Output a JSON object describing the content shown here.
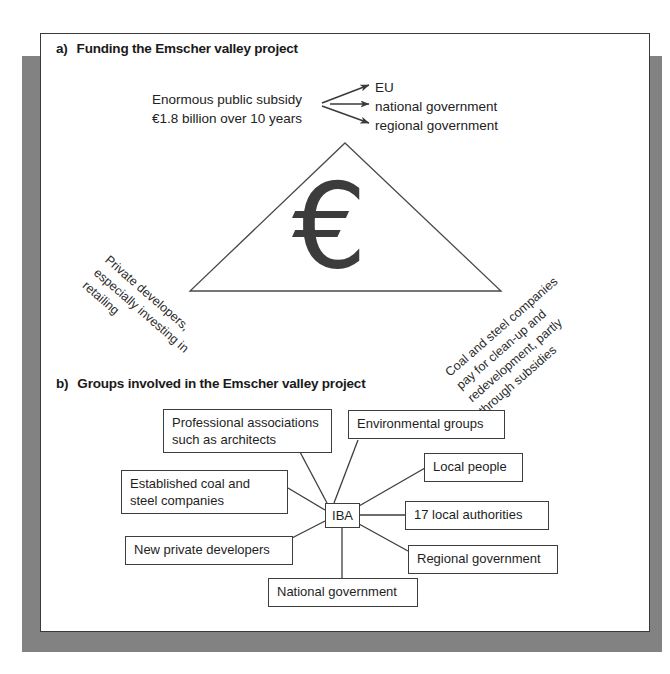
{
  "figure": {
    "sections": [
      {
        "mark": "a)",
        "title": "Funding the Emscher valley project"
      },
      {
        "mark": "b)",
        "title": "Groups involved in the Emscher valley project"
      }
    ]
  },
  "funding": {
    "source_lines": [
      "Enormous public subsidy",
      "€1.8 billion over 10 years"
    ],
    "recipients": [
      "EU",
      "national government",
      "regional government"
    ],
    "currency_symbol": "€",
    "left_caption": [
      "Private developers,",
      "especially investing in",
      "retailing"
    ],
    "right_caption": [
      "Coal and steel companies",
      "pay for clean-up and",
      "redevelopment, partly",
      "through subsidies"
    ]
  },
  "groups": {
    "center": "IBA",
    "nodes": [
      {
        "id": "professional-associations",
        "lines": [
          "Professional associations",
          "such as architects"
        ]
      },
      {
        "id": "environmental-groups",
        "lines": [
          "Environmental groups"
        ]
      },
      {
        "id": "local-people",
        "lines": [
          "Local people"
        ]
      },
      {
        "id": "established-coal-steel",
        "lines": [
          "Established coal and",
          "steel companies"
        ]
      },
      {
        "id": "local-authorities",
        "lines": [
          "17 local authorities"
        ]
      },
      {
        "id": "new-private-developers",
        "lines": [
          "New private developers"
        ]
      },
      {
        "id": "regional-government",
        "lines": [
          "Regional government"
        ]
      },
      {
        "id": "national-government",
        "lines": [
          "National government"
        ]
      }
    ]
  },
  "colors": {
    "frame_shadow": "#828282",
    "panel_border": "#3a3a3a",
    "line": "#3d3d3d",
    "euro": "#3c3c3c",
    "text": "#1e1e1e"
  }
}
